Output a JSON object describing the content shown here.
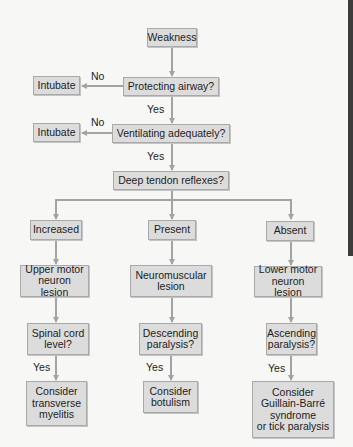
{
  "diagram": {
    "type": "flowchart",
    "nodes": {
      "weakness": "Weakness",
      "protecting_airway": "Protecting airway?",
      "intubate_1": "Intubate",
      "ventilating": "Ventilating adequately?",
      "intubate_2": "Intubate",
      "dtr": "Deep tendon reflexes?",
      "increased": "Increased",
      "present": "Present",
      "absent": "Absent",
      "upper_motor": "Upper motor\nneuron lesion",
      "neuromuscular": "Neuromuscular\nlesion",
      "lower_motor": "Lower motor\nneuron lesion",
      "spinal_cord": "Spinal cord\nlevel?",
      "descending": "Descending\nparalysis?",
      "ascending": "Ascending\nparalysis?",
      "transverse_myelitis": "Consider\ntransverse\nmyelitis",
      "botulism": "Consider\nbotulism",
      "guillain_barre": "Consider\nGuillain-Barré\nsyndrome\nor tick paralysis"
    },
    "edge_labels": {
      "no_1": "No",
      "yes_1": "Yes",
      "no_2": "No",
      "yes_2": "Yes",
      "yes_left": "Yes",
      "yes_mid": "Yes",
      "yes_right": "Yes"
    },
    "colors": {
      "box_fill": "#dcdcdc",
      "box_border": "#a9a9a9",
      "arrow": "#a3a3a3",
      "background": "#f7f7f5",
      "side_bar": "#3c3c3c"
    }
  }
}
